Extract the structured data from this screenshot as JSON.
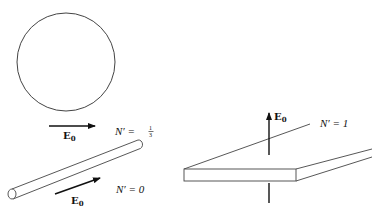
{
  "figure": {
    "sphere": {
      "field_label": "E",
      "field_subscript": "0",
      "depolarization_label": "N′ =",
      "depolarization_numerator": "1",
      "depolarization_denominator": "3"
    },
    "needle": {
      "field_label": "E",
      "field_subscript": "0",
      "depolarization_label": "N′ = 0"
    },
    "slab": {
      "field_label": "E",
      "field_subscript": "0",
      "depolarization_label": "N′ = 1"
    }
  }
}
